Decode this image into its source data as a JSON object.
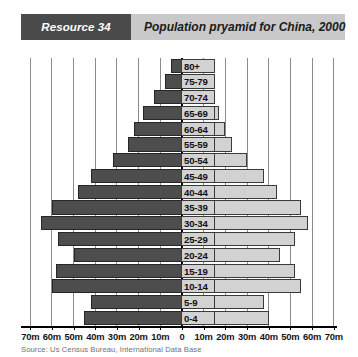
{
  "header": {
    "badge": "Resource 34",
    "title": "Population pryamid for China, 2000"
  },
  "source": "Source: Us Census Bureau, International Data Base",
  "colors": {
    "badge_bg": "#4a4a4a",
    "title_bg": "#c9c9c9",
    "male_bar": "#4d4d4d",
    "female_bar": "#d2d2d2",
    "gridline": "#8b8b8b",
    "axis": "#000000"
  },
  "chart_data": {
    "type": "bar",
    "subtype": "population-pyramid",
    "title": "Population pryamid for China, 2000",
    "xlabel": "",
    "ylabel": "",
    "grid": true,
    "legend": null,
    "units": "millions",
    "xlim": [
      -70,
      70
    ],
    "xticks": [
      -70,
      -60,
      -50,
      -40,
      -30,
      -20,
      -10,
      0,
      10,
      20,
      30,
      40,
      50,
      60,
      70
    ],
    "xticklabels": [
      "70m",
      "60m",
      "50m",
      "40m",
      "30m",
      "20m",
      "10m",
      "0",
      "10m",
      "20m",
      "30m",
      "40m",
      "50m",
      "60m",
      "70m"
    ],
    "categories": [
      "0-4",
      "5-9",
      "10-14",
      "15-19",
      "20-24",
      "25-29",
      "30-34",
      "35-39",
      "40-44",
      "45-49",
      "50-54",
      "55-59",
      "60-64",
      "65-69",
      "70-74",
      "75-79",
      "80+"
    ],
    "series": [
      {
        "name": "Male",
        "side": "left",
        "color": "#4d4d4d",
        "values": [
          45,
          42,
          60,
          58,
          50,
          57,
          65,
          60,
          48,
          42,
          32,
          25,
          22,
          18,
          13,
          8,
          5
        ]
      },
      {
        "name": "Female",
        "side": "right",
        "color": "#d2d2d2",
        "values": [
          40,
          38,
          55,
          52,
          45,
          52,
          58,
          55,
          44,
          38,
          30,
          23,
          20,
          17,
          12,
          8,
          5
        ]
      }
    ]
  }
}
